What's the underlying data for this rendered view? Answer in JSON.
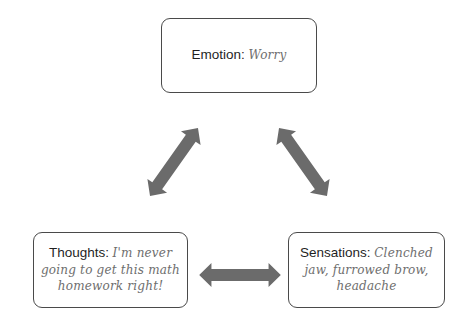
{
  "diagram": {
    "type": "cycle-triangle",
    "arrow_color": "#6b6b6b",
    "border_color": "#4a4a4a",
    "nodes": [
      {
        "id": "emotion",
        "label": "Emotion:",
        "value": "Worry",
        "position": "top"
      },
      {
        "id": "thoughts",
        "label": "Thoughts:",
        "value": "I'm never going to get this math homework right!",
        "position": "bottom-left"
      },
      {
        "id": "sensations",
        "label": "Sensations:",
        "value": "Clenched jaw, furrowed brow, headache",
        "position": "bottom-right"
      }
    ],
    "edges": [
      {
        "from": "emotion",
        "to": "thoughts",
        "bidirectional": true
      },
      {
        "from": "emotion",
        "to": "sensations",
        "bidirectional": true
      },
      {
        "from": "thoughts",
        "to": "sensations",
        "bidirectional": true
      }
    ]
  }
}
